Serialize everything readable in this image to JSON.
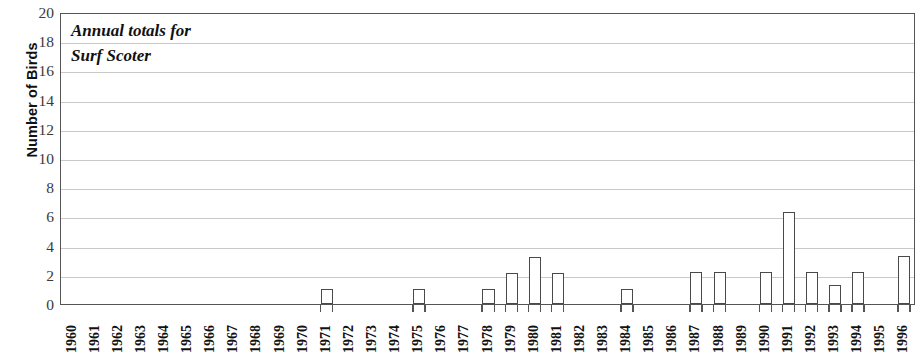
{
  "chart_data": {
    "type": "bar",
    "title": "Annual totals for Surf Scoter",
    "title_lines": [
      "Annual totals for",
      "Surf Scoter"
    ],
    "xlabel": "",
    "ylabel": "Number of Birds",
    "ylim": [
      0,
      20
    ],
    "ytick_step": 2,
    "yticks": [
      20,
      18,
      16,
      14,
      12,
      10,
      8,
      6,
      4,
      2,
      0
    ],
    "grid": true,
    "grid_axis": "y",
    "legend": null,
    "bar_fill_color": "#ffffff",
    "bar_edge_color": "#4a4a4a",
    "categories": [
      "1960",
      "1961",
      "1962",
      "1963",
      "1964",
      "1965",
      "1966",
      "1967",
      "1968",
      "1969",
      "1970",
      "1971",
      "1972",
      "1973",
      "1974",
      "1975",
      "1976",
      "1977",
      "1978",
      "1979",
      "1980",
      "1981",
      "1982",
      "1983",
      "1984",
      "1985",
      "1986",
      "1987",
      "1988",
      "1989",
      "1990",
      "1991",
      "1992",
      "1993",
      "1994",
      "1995",
      "1996"
    ],
    "values": [
      0,
      0,
      0,
      0,
      0,
      0,
      0,
      0,
      0,
      0,
      0,
      1,
      0,
      0,
      0,
      1,
      0,
      0,
      1,
      2.1,
      3.2,
      2.1,
      0,
      0,
      1,
      0,
      0,
      2.2,
      2.2,
      0,
      2.2,
      6.3,
      2.2,
      1.3,
      2.2,
      0,
      3.3
    ]
  }
}
